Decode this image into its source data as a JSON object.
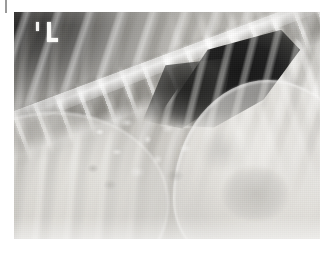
{
  "viewer": {
    "name": "radiograph-viewer",
    "width": 329,
    "height": 254,
    "background_color": "#ffffff",
    "alt_text": "Lateral radiograph of thorax and cranial abdomen"
  },
  "film": {
    "name": "radiograph-image",
    "left": 14,
    "top": 12,
    "width": 306,
    "height": 227,
    "modality": "radiograph",
    "view": "lateral",
    "base_tone": "#b9b7b2",
    "alt_text": "Grayscale X-ray showing ribs, thoracic vertebral column, a dark triangular gas-filled region and overlapping soft tissue organ shadows"
  },
  "annotations": {
    "side_marker": {
      "name": "radiographic-side-marker",
      "glyph": "L",
      "color": "#f4f4f2",
      "left": 28,
      "top": 10
    },
    "corner_tick": {
      "name": "marker-tick",
      "color": "#efefed",
      "left": 22,
      "top": 10
    },
    "edge_tick": {
      "name": "corner-tick-mark",
      "color": "#9a9a9a",
      "left": 5,
      "top": 0
    }
  },
  "anatomy": [
    {
      "name": "rib-cage-upper",
      "label": "Ribs (dorsal)",
      "tone": "bright-striped"
    },
    {
      "name": "rib-cage-left-lower",
      "label": "Ribs (caudal left)",
      "tone": "mid-striped"
    },
    {
      "name": "rib-cage-right-fan",
      "label": "Ribs (fan, right)",
      "tone": "bright-striped"
    },
    {
      "name": "vertebral-column",
      "label": "Thoracic vertebrae",
      "tone": "bright-segmented"
    },
    {
      "name": "gas-triangle",
      "label": "Gas / lung lucency",
      "tone": "#1b1b1b"
    },
    {
      "name": "diaphragm-dome-right",
      "label": "Diaphragmatic dome",
      "tone": "soft-bright"
    },
    {
      "name": "diaphragm-dome-left",
      "label": "Organ silhouette (left)",
      "tone": "soft-bright"
    },
    {
      "name": "bowel-mottle",
      "label": "Mottled bowel gas",
      "tone": "granular"
    },
    {
      "name": "viscus-shadow",
      "label": "Rounded viscus shadow",
      "tone": "faint-gray"
    }
  ],
  "colors": {
    "film_light": "#d8d6d1",
    "film_mid": "#bdbbb6",
    "film_dark": "#1b1b1b",
    "marker_white": "#f4f4f2",
    "page_white": "#ffffff"
  }
}
